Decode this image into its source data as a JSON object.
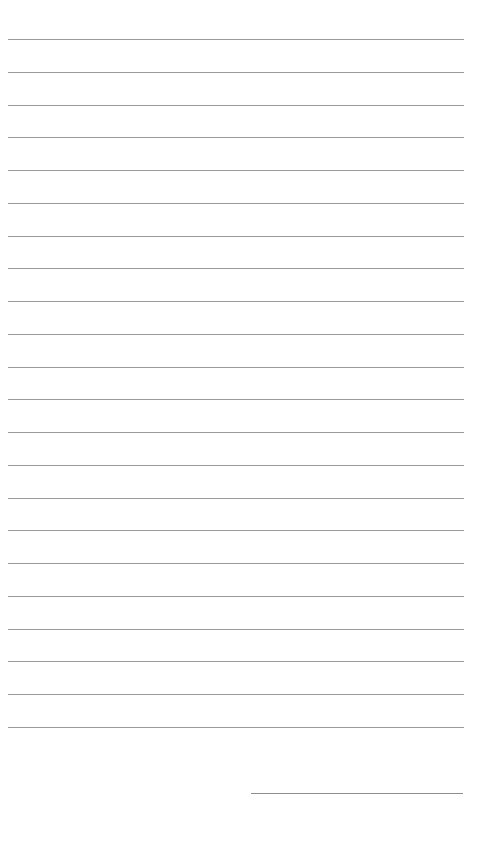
{
  "page": {
    "type": "lined-paper",
    "background_color": "#ffffff",
    "line_color": "#9a9a9a",
    "ruled_lines": {
      "count": 22,
      "first_y": 39,
      "spacing": 32.76,
      "left_x": 8,
      "right_x": 464
    },
    "signature_line": {
      "y": 793,
      "left_x": 251,
      "right_x": 463
    }
  }
}
